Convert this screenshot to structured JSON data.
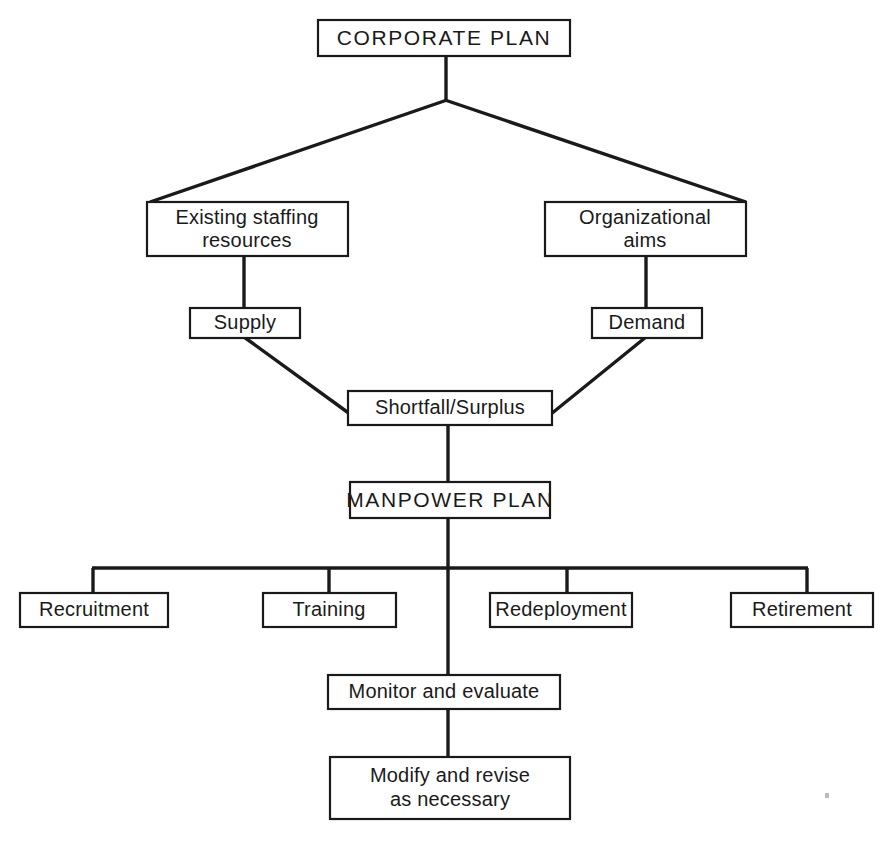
{
  "diagram": {
    "type": "flowchart",
    "orientation": "top-down",
    "background_color": "#ffffff",
    "line_color": "#1a1a1a",
    "box_fill_color": "#ffffff",
    "nodes": {
      "corporate_plan": {
        "label": "CORPORATE PLAN",
        "style": "uppercase",
        "level": 1
      },
      "existing_staffing_resources": {
        "label_line1": "Existing staffing",
        "label_line2": "resources",
        "level": 2
      },
      "organizational_aims": {
        "label_line1": "Organizational",
        "label_line2": "aims",
        "level": 2
      },
      "supply": {
        "label": "Supply",
        "level": 3
      },
      "demand": {
        "label": "Demand",
        "level": 3
      },
      "shortfall_surplus": {
        "label": "Shortfall/Surplus",
        "level": 4
      },
      "manpower_plan": {
        "label": "MANPOWER PLAN",
        "style": "uppercase",
        "level": 5
      },
      "recruitment": {
        "label": "Recruitment",
        "level": 6
      },
      "training": {
        "label": "Training",
        "level": 6
      },
      "redeployment": {
        "label": "Redeployment",
        "level": 6
      },
      "retirement": {
        "label": "Retirement",
        "level": 6
      },
      "monitor_and_evaluate": {
        "label": "Monitor and evaluate",
        "level": 7
      },
      "modify_and_revise": {
        "label_line1": "Modify and revise",
        "label_line2": "as necessary",
        "level": 8
      }
    },
    "edges": [
      {
        "from": "corporate_plan",
        "to": "existing_staffing_resources",
        "style": "diagonal"
      },
      {
        "from": "corporate_plan",
        "to": "organizational_aims",
        "style": "diagonal"
      },
      {
        "from": "existing_staffing_resources",
        "to": "supply",
        "style": "vertical"
      },
      {
        "from": "organizational_aims",
        "to": "demand",
        "style": "vertical"
      },
      {
        "from": "supply",
        "to": "shortfall_surplus",
        "style": "diagonal"
      },
      {
        "from": "demand",
        "to": "shortfall_surplus",
        "style": "diagonal"
      },
      {
        "from": "shortfall_surplus",
        "to": "manpower_plan",
        "style": "vertical"
      },
      {
        "from": "manpower_plan",
        "to": "recruitment",
        "style": "orthogonal-bus"
      },
      {
        "from": "manpower_plan",
        "to": "training",
        "style": "orthogonal-bus"
      },
      {
        "from": "manpower_plan",
        "to": "redeployment",
        "style": "orthogonal-bus"
      },
      {
        "from": "manpower_plan",
        "to": "retirement",
        "style": "orthogonal-bus"
      },
      {
        "from": "manpower_plan",
        "to": "monitor_and_evaluate",
        "style": "vertical"
      },
      {
        "from": "monitor_and_evaluate",
        "to": "modify_and_revise",
        "style": "vertical"
      }
    ]
  }
}
